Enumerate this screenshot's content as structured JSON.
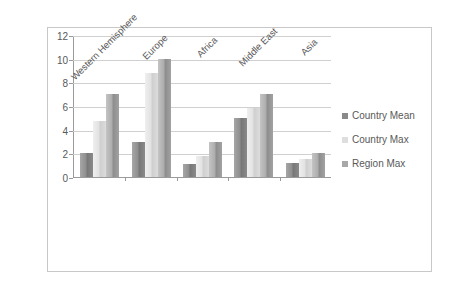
{
  "chart_data": {
    "type": "bar",
    "title": "",
    "subtitle": "",
    "xlabel": "",
    "ylabel": "",
    "categories": [
      "Western Hemisphere",
      "Europe",
      "Africa",
      "Middle East",
      "Asia"
    ],
    "series": [
      {
        "name": "Country Mean",
        "color": "#8a8a8a",
        "values": [
          2.0,
          3.0,
          1.1,
          5.0,
          1.2
        ]
      },
      {
        "name": "Country Max",
        "color": "#dedede",
        "values": [
          4.7,
          8.8,
          1.8,
          5.8,
          1.5
        ]
      },
      {
        "name": "Region Max",
        "color": "#a8a8a8",
        "values": [
          7.0,
          10.0,
          3.0,
          7.0,
          2.0
        ]
      }
    ],
    "ylim": [
      0,
      12
    ],
    "yticks": [
      0,
      2,
      4,
      6,
      8,
      10,
      12
    ],
    "ytick_labels": [
      "0",
      "2",
      "4",
      "6",
      "8",
      "10",
      "12"
    ],
    "grid": true,
    "grid_axis": "y",
    "legend_position": "right",
    "border": true,
    "xtick_label_rotation": -45
  }
}
